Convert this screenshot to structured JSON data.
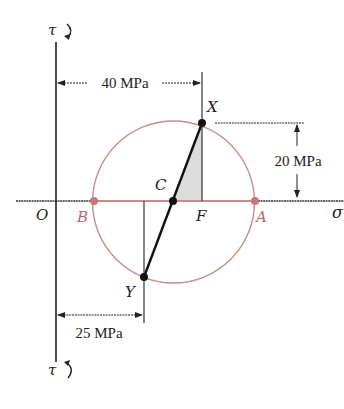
{
  "diagram": {
    "type": "mohr-circle",
    "axes": {
      "horizontal_label": "σ",
      "vertical_top_label": "τ",
      "vertical_bottom_label": "τ",
      "origin_label": "O"
    },
    "points": {
      "X": {
        "label": "X",
        "sigma_mpa": 40,
        "tau_mpa": 20
      },
      "Y": {
        "label": "Y",
        "sigma_mpa": 25,
        "tau_mpa": -20
      },
      "C": {
        "label": "C"
      },
      "F": {
        "label": "F"
      },
      "A": {
        "label": "A"
      },
      "B": {
        "label": "B"
      }
    },
    "dimensions": {
      "x_offset": "40 MPa",
      "x_shear": "20 MPa",
      "y_offset": "25 MPa"
    },
    "colors": {
      "circle": "#c98c8c",
      "axis_diameter": "#c98c8c",
      "point_label_red": "#b76b6b",
      "ink": "#1a1a1a",
      "shade": "#dcdcdc"
    }
  }
}
